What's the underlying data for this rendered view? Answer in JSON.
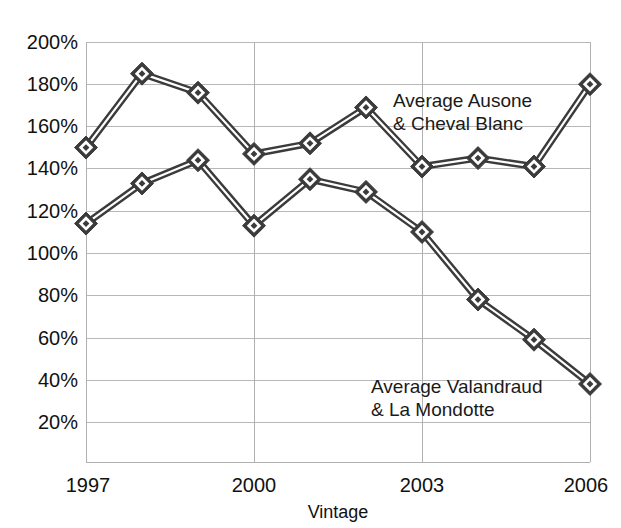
{
  "chart_data": {
    "type": "line",
    "title": "",
    "xlabel": "Vintage",
    "ylabel": "",
    "x": [
      1997,
      1998,
      1999,
      2000,
      2001,
      2002,
      2003,
      2004,
      2005,
      2006
    ],
    "xtick_labels": [
      "1997",
      "2000",
      "2003",
      "2006"
    ],
    "xtick_values": [
      1997,
      2000,
      2003,
      2006
    ],
    "ytick_labels": [
      "200%",
      "180%",
      "160%",
      "140%",
      "120%",
      "100%",
      "80%",
      "60%",
      "40%",
      "20%"
    ],
    "ytick_values": [
      200,
      180,
      160,
      140,
      120,
      100,
      80,
      60,
      40,
      20
    ],
    "ylim": [
      10,
      200
    ],
    "xlim": [
      1997,
      2006
    ],
    "grid": true,
    "legend_position": "inline-annotation",
    "series": [
      {
        "name": "Average Ausone & Cheval Blanc",
        "values": [
          150,
          185,
          176,
          147,
          152,
          169,
          141,
          145,
          141,
          180
        ],
        "color": "#3b3b3b",
        "annotation_line1": "Average Ausone",
        "annotation_line2": "& Cheval Blanc"
      },
      {
        "name": "Average Valandraud & La Mondotte",
        "values": [
          114,
          133,
          144,
          113,
          135,
          129,
          110,
          78,
          59,
          38
        ],
        "color": "#3b3b3b",
        "annotation_line1": "Average Valandraud",
        "annotation_line2": "& La Mondotte"
      }
    ],
    "annotations": [
      {
        "id": "ausone-label",
        "line1": "Average Ausone",
        "line2": "& Cheval Blanc",
        "x": 393,
        "y": 100
      },
      {
        "id": "valandraud-label",
        "line1": "Average Valandraud",
        "line2": "& La Mondotte",
        "x": 371,
        "y": 390
      }
    ]
  },
  "axes": {
    "x_title": "Vintage"
  }
}
